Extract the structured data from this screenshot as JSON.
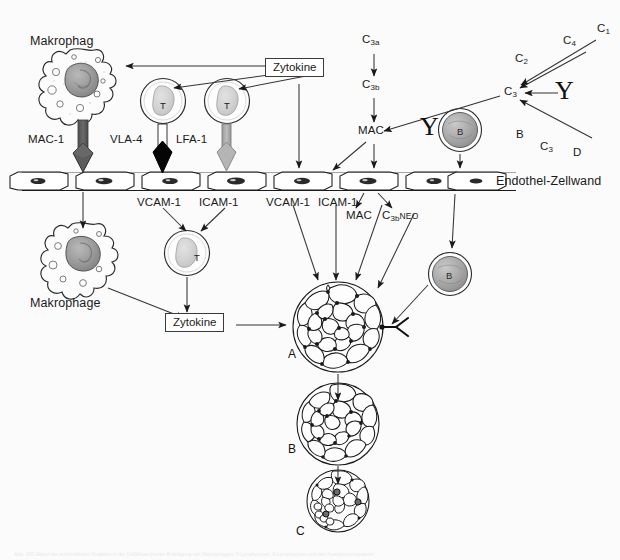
{
  "figure": {
    "title_top_left": "Makrophag",
    "title_bottom_left": "Makrophage",
    "endothelium_label": "Endothel-Zellwand",
    "background_color": "#fbfbfb",
    "ink_color": "#1a1a1a"
  },
  "cells": {
    "macrophage_top": "Makrophag",
    "macrophage_bottom": "Makrophage",
    "t_cell_1": "T",
    "t_cell_2": "T",
    "t_cell_3": "T",
    "b_cell_top": "B",
    "b_cell_bottom": "B"
  },
  "adhesion": {
    "mac1": "MAC-1",
    "vla4": "VLA-4",
    "lfa1": "LFA-1",
    "mac1_color": "#5d5d5d",
    "vla4_color": "#000000",
    "lfa1_color": "#b5b5b5"
  },
  "ligands": {
    "vcam1_a": "VCAM-1",
    "icam1_a": "ICAM-1",
    "vcam1_b": "VCAM-1",
    "icam1_b": "ICAM-1"
  },
  "signals": {
    "zytokine_top": "Zytokine",
    "zytokine_bottom": "Zytokine"
  },
  "complement": {
    "c3a": "C",
    "c3a_sub": "3a",
    "c3b": "C",
    "c3b_sub": "3b",
    "mac_above": "MAC",
    "mac_below": "MAC",
    "c3bneo": "C",
    "c3bneo_sub": "3b",
    "c3bneo_neo": "NEO",
    "c3_center": "C",
    "c3_center_sub": "3",
    "classical": [
      {
        "name": "C",
        "sub": "1"
      },
      {
        "name": "C",
        "sub": "4"
      },
      {
        "name": "C",
        "sub": "2"
      }
    ],
    "alternative": [
      {
        "name": "B",
        "sub": ""
      },
      {
        "name": "C",
        "sub": "3"
      },
      {
        "name": "D",
        "sub": ""
      }
    ],
    "antibody_glyph": "Y"
  },
  "antibodies": {
    "y_pathway": "Y",
    "y_free": "Y"
  },
  "clusters": {
    "a": "A",
    "b": "B",
    "c": "C"
  },
  "caption": {
    "text": "Abb. 000   Ablauf der entzündlichen Reaktion in der Gefäßwand unter Beteiligung von Makrophagen, T-Lymphozyten, B-Lymphozyten und des Komplementsystems."
  }
}
